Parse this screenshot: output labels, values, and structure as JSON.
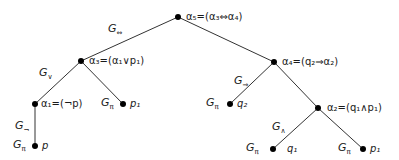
{
  "diagram": {
    "type": "formula-parse-tree",
    "nodes": [
      {
        "id": "a5",
        "x": 178,
        "y": 17,
        "label": "α₅=(α₃⇔α₄)"
      },
      {
        "id": "a3",
        "x": 81,
        "y": 61,
        "label": "α₃=(α₁∨p₁)"
      },
      {
        "id": "a4",
        "x": 274,
        "y": 62,
        "label": "α₄=(q₂⇒α₂)"
      },
      {
        "id": "a1",
        "x": 35,
        "y": 104,
        "label": "α₁=(¬p)"
      },
      {
        "id": "p1_left",
        "x": 123,
        "y": 104,
        "label": "p₁"
      },
      {
        "id": "q2",
        "x": 230,
        "y": 104,
        "label": "q₂"
      },
      {
        "id": "a2",
        "x": 318,
        "y": 108,
        "label": "α₂=(q₁∧p₁)"
      },
      {
        "id": "p",
        "x": 35,
        "y": 146,
        "label": "p"
      },
      {
        "id": "q1",
        "x": 273,
        "y": 149,
        "label": "q₁"
      },
      {
        "id": "p1_right",
        "x": 363,
        "y": 149,
        "label": "p₁"
      }
    ],
    "edges": [
      {
        "from": "a5",
        "to": "a3",
        "label": "G⇔"
      },
      {
        "from": "a5",
        "to": "a4"
      },
      {
        "from": "a3",
        "to": "a1",
        "label": "G∨"
      },
      {
        "from": "a3",
        "to": "p1_left"
      },
      {
        "from": "a4",
        "to": "q2",
        "label": "G⇒"
      },
      {
        "from": "a4",
        "to": "a2"
      },
      {
        "from": "a1",
        "to": "p",
        "label": "G¬"
      },
      {
        "from": "a2",
        "to": "q1",
        "label": "G∧"
      },
      {
        "from": "a2",
        "to": "p1_right"
      }
    ],
    "leaf_rule_labels": [
      {
        "node": "p",
        "label": "Gπ"
      },
      {
        "node": "p1_left",
        "label": "Gπ"
      },
      {
        "node": "q2",
        "label": "Gπ"
      },
      {
        "node": "q1",
        "label": "Gπ"
      },
      {
        "node": "p1_right",
        "label": "Gπ"
      }
    ]
  },
  "labels": {
    "a5": "α₅=(α₃⇔α₄)",
    "a3": "α₃=(α₁∨p₁)",
    "a4": "α₄=(q₂⇒α₂)",
    "a1": "α₁=(¬p)",
    "a2": "α₂=(q₁∧p₁)",
    "p": "p",
    "p1_left": "p₁",
    "q2": "q₂",
    "q1": "q₁",
    "p1_right": "p₁"
  },
  "rules": {
    "iff": {
      "base": "G",
      "sub": "⇔"
    },
    "or": {
      "base": "G",
      "sub": "∨"
    },
    "imp": {
      "base": "G",
      "sub": "⇒"
    },
    "not": {
      "base": "G",
      "sub": "¬"
    },
    "and": {
      "base": "G",
      "sub": "∧"
    },
    "pi": {
      "base": "G",
      "sub": "π"
    }
  }
}
